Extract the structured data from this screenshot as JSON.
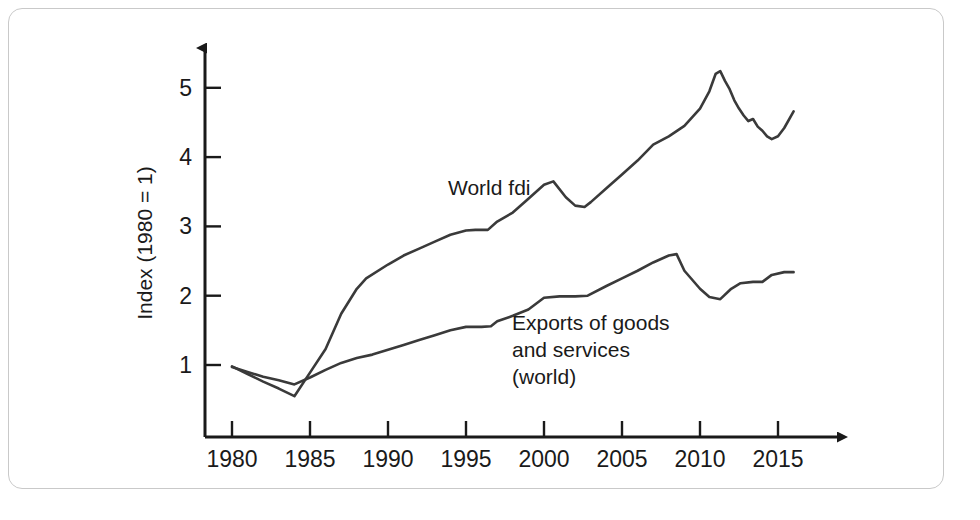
{
  "figure": {
    "background_color": "#ffffff",
    "frame_color": "#c9c9c9",
    "line_color": "#3a3a3a",
    "axis_color": "#1a1a1a"
  },
  "chart_data": {
    "type": "line",
    "title": "",
    "xlabel": "",
    "ylabel": "Index (1980 = 1)",
    "xlim": [
      1978.5,
      2017.5
    ],
    "ylim": [
      0,
      5.6
    ],
    "grid": false,
    "legend_position": "inline-annotation",
    "xticks": [
      1980,
      1985,
      1990,
      1995,
      2000,
      2005,
      2010,
      2015
    ],
    "xtick_labels": [
      "1980",
      "1985",
      "1990",
      "1995",
      "2000",
      "2005",
      "2010",
      "2015"
    ],
    "yticks": [
      1,
      2,
      3,
      4,
      5
    ],
    "ytick_labels": [
      "1",
      "2",
      "3",
      "4",
      "5"
    ],
    "series": [
      {
        "name": "World fdi",
        "label": "World fdi",
        "color": "#3a3a3a",
        "x": [
          1980,
          1981,
          1982,
          1983,
          1984,
          1985,
          1986,
          1987,
          1988,
          1988.6,
          1990,
          1991,
          1992,
          1993,
          1994,
          1995,
          1995.6,
          1996.4,
          1997,
          1998,
          1999,
          2000,
          2000.6,
          2001.4,
          2002,
          2002.6,
          2003,
          2004,
          2005,
          2006,
          2007,
          2008,
          2009,
          2010,
          2010.6,
          2011,
          2011.3,
          2011.6,
          2011.9,
          2012.2,
          2012.5,
          2012.8,
          2013.1,
          2013.4,
          2013.7,
          2014,
          2014.3,
          2014.6,
          2015,
          2015.4,
          2016
        ],
        "y": [
          0.98,
          0.87,
          0.76,
          0.66,
          0.55,
          0.89,
          1.23,
          1.74,
          2.1,
          2.25,
          2.45,
          2.58,
          2.68,
          2.78,
          2.88,
          2.94,
          2.95,
          2.95,
          3.07,
          3.2,
          3.4,
          3.6,
          3.65,
          3.42,
          3.3,
          3.28,
          3.35,
          3.55,
          3.75,
          3.95,
          4.18,
          4.3,
          4.45,
          4.7,
          4.95,
          5.2,
          5.24,
          5.1,
          4.98,
          4.82,
          4.7,
          4.6,
          4.52,
          4.55,
          4.44,
          4.38,
          4.3,
          4.26,
          4.3,
          4.42,
          4.66
        ]
      },
      {
        "name": "Exports of goods and services (world)",
        "label": "Exports of goods\nand services\n(world)",
        "color": "#3a3a3a",
        "x": [
          1980,
          1981,
          1982,
          1983,
          1984,
          1985,
          1986,
          1987,
          1988,
          1989,
          1990,
          1991,
          1992,
          1993,
          1994,
          1995,
          1996,
          1996.6,
          1997,
          1998,
          1999,
          2000,
          2001,
          2002,
          2002.8,
          2004,
          2005,
          2006,
          2007,
          2008,
          2008.5,
          2009,
          2010,
          2010.6,
          2011.3,
          2012,
          2012.6,
          2013.4,
          2014,
          2014.6,
          2015.4,
          2016
        ],
        "y": [
          0.97,
          0.9,
          0.83,
          0.78,
          0.72,
          0.82,
          0.93,
          1.03,
          1.1,
          1.15,
          1.22,
          1.29,
          1.36,
          1.43,
          1.5,
          1.55,
          1.55,
          1.56,
          1.63,
          1.71,
          1.8,
          1.97,
          1.99,
          1.99,
          2.0,
          2.14,
          2.25,
          2.36,
          2.48,
          2.58,
          2.6,
          2.36,
          2.1,
          1.98,
          1.95,
          2.1,
          2.18,
          2.2,
          2.2,
          2.3,
          2.34,
          2.34
        ]
      }
    ],
    "annotations": [
      {
        "name": "world-fdi-label",
        "text": "World fdi",
        "x_px": 448,
        "y_px": 195
      },
      {
        "name": "exports-label-line-1",
        "text": "Exports of goods",
        "x_px": 512,
        "y_px": 330
      },
      {
        "name": "exports-label-line-2",
        "text": "and services",
        "x_px": 512,
        "y_px": 357
      },
      {
        "name": "exports-label-line-3",
        "text": "(world)",
        "x_px": 512,
        "y_px": 384
      }
    ]
  }
}
